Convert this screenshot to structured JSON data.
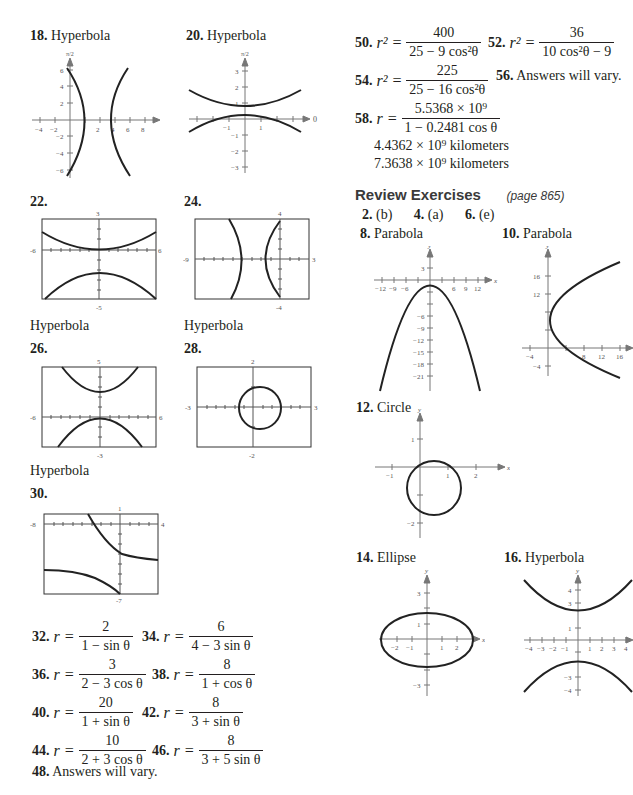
{
  "left": {
    "ex18": {
      "num": "18.",
      "label": "Hyperbola"
    },
    "ex20": {
      "num": "20.",
      "label": "Hyperbola"
    },
    "ex22": {
      "num": "22.",
      "caption": "Hyperbola",
      "window": {
        "xmin": "-6",
        "xmax": "6",
        "ymin": "-5",
        "ymax": "3"
      }
    },
    "ex24": {
      "num": "24.",
      "caption": "Hyperbola",
      "window": {
        "xmin": "-9",
        "xmax": "3",
        "ymin": "-4",
        "ymax": "4"
      }
    },
    "ex26": {
      "num": "26.",
      "caption": "Hyperbola",
      "window": {
        "xmin": "-6",
        "xmax": "6",
        "ymin": "-3",
        "ymax": "5"
      }
    },
    "ex28": {
      "num": "28.",
      "window": {
        "xmin": "-3",
        "xmax": "3",
        "ymin": "-2",
        "ymax": "2"
      }
    },
    "ex30": {
      "num": "30.",
      "window": {
        "xmin": "-8",
        "xmax": "4",
        "ymin": "-7",
        "ymax": "1"
      }
    },
    "equations": [
      {
        "num": "32.",
        "lhs": "r =",
        "n": "2",
        "d": "1 − sin θ"
      },
      {
        "num": "34.",
        "lhs": "r =",
        "n": "6",
        "d": "4 − 3 sin θ"
      },
      {
        "num": "36.",
        "lhs": "r =",
        "n": "3",
        "d": "2 − 3 cos θ"
      },
      {
        "num": "38.",
        "lhs": "r =",
        "n": "8",
        "d": "1 + cos θ"
      },
      {
        "num": "40.",
        "lhs": "r =",
        "n": "20",
        "d": "1 + sin θ"
      },
      {
        "num": "42.",
        "lhs": "r =",
        "n": "8",
        "d": "3 + sin θ"
      },
      {
        "num": "44.",
        "lhs": "r =",
        "n": "10",
        "d": "2 + 3 cos θ"
      },
      {
        "num": "46.",
        "lhs": "r =",
        "n": "8",
        "d": "3 + 5 sin θ"
      }
    ],
    "ex48": {
      "num": "48.",
      "text": "Answers will vary."
    }
  },
  "right": {
    "ex50": {
      "num": "50.",
      "lhs": "r² =",
      "n": "400",
      "d": "25 − 9 cos²θ"
    },
    "ex52": {
      "num": "52.",
      "lhs": "r² =",
      "n": "36",
      "d": "10 cos²θ − 9"
    },
    "ex54": {
      "num": "54.",
      "lhs": "r² =",
      "n": "225",
      "d": "25 − 16 cos²θ"
    },
    "ex56": {
      "num": "56.",
      "text": "Answers will vary."
    },
    "ex58": {
      "num": "58.",
      "lhs": "r =",
      "n": "5.5368 × 10⁹",
      "d": "1 − 0.2481 cos θ",
      "line1": "4.4362 × 10⁹ kilometers",
      "line2": "7.3638 × 10⁹ kilometers"
    },
    "review": {
      "title": "Review Exercises",
      "page": "(page 865)"
    },
    "answers": [
      {
        "num": "2.",
        "val": "(b)"
      },
      {
        "num": "4.",
        "val": "(a)"
      },
      {
        "num": "6.",
        "val": "(e)"
      }
    ],
    "ex8": {
      "num": "8.",
      "label": "Parabola"
    },
    "ex10": {
      "num": "10.",
      "label": "Parabola"
    },
    "ex12": {
      "num": "12.",
      "label": "Circle"
    },
    "ex14": {
      "num": "14.",
      "label": "Ellipse"
    },
    "ex16": {
      "num": "16.",
      "label": "Hyperbola"
    }
  },
  "axes": {
    "x": "x",
    "y": "y",
    "zero": "0",
    "halfpi": "π/2"
  }
}
